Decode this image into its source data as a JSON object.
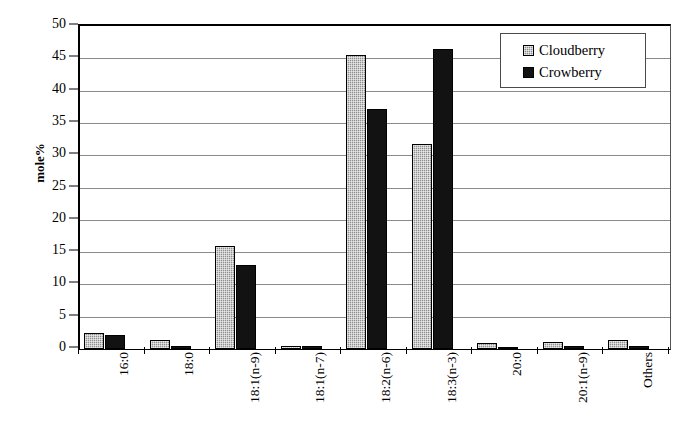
{
  "chart_data": {
    "type": "bar",
    "title": "",
    "xlabel": "",
    "ylabel": "mole%",
    "ylim": [
      0,
      50
    ],
    "ytick_step": 5,
    "yticks": [
      "0",
      "5",
      "10",
      "15",
      "20",
      "25",
      "30",
      "35",
      "40",
      "45",
      "50"
    ],
    "grid": true,
    "legend_position": "top-right",
    "categories": [
      "16:0",
      "18:0",
      "18:1(n-9)",
      "18:1(n-7)",
      "18:2(n-6)",
      "18:3(n-3)",
      "20:0",
      "20:1(n-9)",
      "Others"
    ],
    "series": [
      {
        "name": "Cloudberry",
        "color": "#8f8f8f",
        "pattern": "cross-hatch",
        "values": [
          2.5,
          1.4,
          16.0,
          0.5,
          45.5,
          31.7,
          1.0,
          1.1,
          1.4
        ]
      },
      {
        "name": "Crowberry",
        "color": "#121212",
        "pattern": "solid",
        "values": [
          2.2,
          0.4,
          13.0,
          0.5,
          37.2,
          46.4,
          0.1,
          0.4,
          0.4
        ]
      }
    ]
  },
  "legend": {
    "entries": [
      {
        "label": "Cloudberry"
      },
      {
        "label": "Crowberry"
      }
    ]
  }
}
